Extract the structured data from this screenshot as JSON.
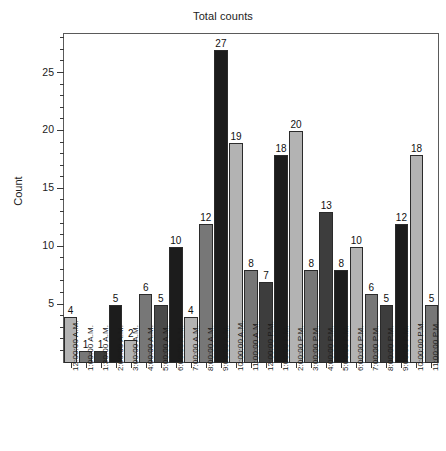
{
  "chart_data": {
    "type": "bar",
    "title": "Total counts",
    "xlabel": "",
    "ylabel": "Count",
    "ylim": [
      0,
      28.5
    ],
    "yticks_major": [
      5,
      10,
      15,
      20,
      25
    ],
    "ytick_step_minor": 1,
    "grid": false,
    "legend": "none",
    "value_labels_shown": true,
    "categories": [
      "12:00:00 A.M.",
      "1:00:00 A.M.",
      "1:30:00 A.M.",
      "2:00:00 A.M.",
      "3:00:00 A.M.",
      "4:00:00 A.M.",
      "5:00:00 A.M.",
      "6:00:00 A.M.",
      "7:00:00 A.M.",
      "8:00:00 A.M.",
      "9:00:00 A.M.",
      "10:00:00 A.M.",
      "11:00:00 A.M.",
      "12:00:00 P.M.",
      "1:00:00 P.M.",
      "2:00:00 P.M.",
      "3:00:00 P.M.",
      "4:00:00 P.M.",
      "5:00:00 P.M.",
      "6:00:00 P.M.",
      "7:00:00 P.M.",
      "8:00:00 P.M.",
      "9:00:00 P.M.",
      "10:00:00 P.M.",
      "11:00:00 P.M."
    ],
    "values": [
      4,
      1,
      1,
      5,
      2,
      6,
      5,
      10,
      4,
      12,
      27,
      19,
      8,
      7,
      18,
      20,
      8,
      13,
      8,
      10,
      6,
      5,
      12,
      18,
      5
    ],
    "bar_colors": [
      "#b3b3b3",
      "#777777",
      "#3d3d3d",
      "#1c1c1c",
      "#b3b3b3",
      "#777777",
      "#4a4a4a",
      "#1c1c1c",
      "#b3b3b3",
      "#777777",
      "#1c1c1c",
      "#b3b3b3",
      "#777777",
      "#3d3d3d",
      "#1c1c1c",
      "#b3b3b3",
      "#777777",
      "#3d3d3d",
      "#1c1c1c",
      "#b3b3b3",
      "#777777",
      "#3d3d3d",
      "#1c1c1c",
      "#b3b3b3",
      "#777777"
    ]
  },
  "style": {
    "axis_color": "#5a5a5a",
    "tick_color": "#3a3a3a",
    "text_color": "#1a1a1a",
    "plot_background": "#ffffff"
  }
}
